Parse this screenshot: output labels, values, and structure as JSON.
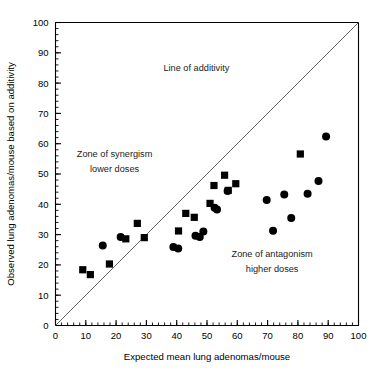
{
  "chart_data": {
    "type": "scatter",
    "title": "",
    "xlabel": "Expected mean lung adenomas/mouse",
    "ylabel": "Observed lung adenomas/mouse based on additivity",
    "xlim": [
      0,
      100
    ],
    "ylim": [
      0,
      100
    ],
    "xticks": [
      0,
      10,
      20,
      30,
      40,
      50,
      60,
      70,
      80,
      90,
      100
    ],
    "yticks": [
      0,
      10,
      20,
      30,
      40,
      50,
      60,
      70,
      80,
      90,
      100
    ],
    "xtick_labels": [
      "0",
      "10",
      "20",
      "30",
      "40",
      "50",
      "60",
      "70",
      "80",
      "90",
      "100"
    ],
    "ytick_labels": [
      "0",
      "10",
      "20",
      "30",
      "40",
      "50",
      "60",
      "70",
      "80",
      "90",
      "100"
    ],
    "minor_tick_step": 2,
    "grid": false,
    "legend": "none",
    "reference_line": {
      "name": "line-of-additivity",
      "kind": "identity",
      "from": [
        0,
        0
      ],
      "to": [
        100,
        100
      ],
      "label": "Line of additivity"
    },
    "series": [
      {
        "name": "square-markers",
        "marker": "square",
        "color": "#000000",
        "points": [
          [
            9.0,
            18.4
          ],
          [
            11.5,
            16.8
          ],
          [
            17.8,
            20.3
          ],
          [
            23.2,
            28.6
          ],
          [
            27.0,
            33.7
          ],
          [
            29.3,
            29.0
          ],
          [
            40.6,
            31.2
          ],
          [
            43.0,
            37.0
          ],
          [
            45.8,
            35.7
          ],
          [
            51.0,
            40.3
          ],
          [
            52.3,
            46.2
          ],
          [
            55.8,
            49.6
          ],
          [
            57.0,
            44.6
          ],
          [
            59.5,
            46.8
          ],
          [
            80.8,
            56.6
          ]
        ]
      },
      {
        "name": "circle-markers",
        "marker": "circle",
        "color": "#000000",
        "points": [
          [
            15.6,
            26.4
          ],
          [
            21.5,
            29.2
          ],
          [
            38.9,
            25.9
          ],
          [
            40.5,
            25.4
          ],
          [
            46.2,
            29.6
          ],
          [
            47.6,
            29.2
          ],
          [
            48.8,
            31.0
          ],
          [
            52.5,
            38.9
          ],
          [
            53.3,
            38.3
          ],
          [
            56.8,
            44.4
          ],
          [
            69.7,
            41.4
          ],
          [
            71.8,
            31.3
          ],
          [
            75.5,
            43.2
          ],
          [
            77.8,
            35.5
          ],
          [
            83.2,
            43.5
          ],
          [
            86.8,
            47.7
          ],
          [
            89.3,
            62.4
          ]
        ]
      }
    ],
    "annotations": [
      {
        "name": "line-of-additivity-label",
        "text": "Line of additivity",
        "x": 46.5,
        "y": 84.0,
        "align": "middle"
      },
      {
        "name": "zone-of-synergism-label-line1",
        "text": "Zone of synergism",
        "x": 19.5,
        "y": 55.5,
        "align": "middle"
      },
      {
        "name": "zone-of-synergism-label-line2",
        "text": "lower doses",
        "x": 19.5,
        "y": 50.5,
        "align": "middle"
      },
      {
        "name": "zone-of-antagonism-label-line1",
        "text": "Zone of antagonism",
        "x": 71.5,
        "y": 22.5,
        "align": "middle"
      },
      {
        "name": "zone-of-antagonism-label-line2",
        "text": "higher doses",
        "x": 71.5,
        "y": 17.5,
        "align": "middle"
      }
    ]
  }
}
